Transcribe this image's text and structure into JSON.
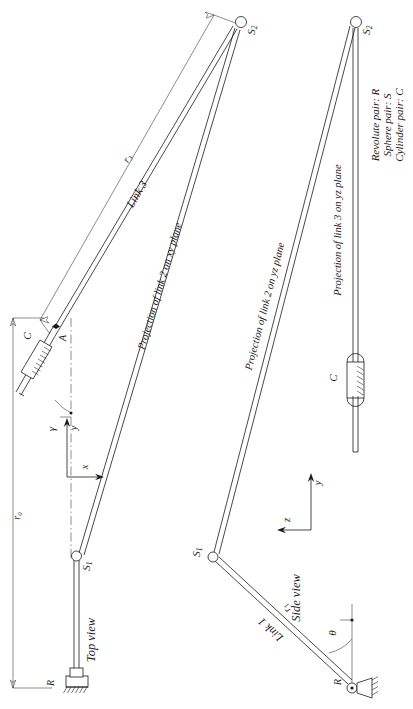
{
  "figure": {
    "views": {
      "top": "Top view",
      "side": "Side view"
    },
    "legend": {
      "items": [
        "Revolute pair: R",
        "Sphere pair: S",
        "Cylinder pair: C"
      ]
    },
    "labels": {
      "s1_top": "S₁",
      "s2_top": "S₂",
      "s1_side": "S₁",
      "s2_side": "S₂",
      "point_a": "A",
      "joint_c_top": "C",
      "joint_c_side": "C",
      "joint_r_top": "R",
      "joint_r_side": "R",
      "link1": "Link 1",
      "link3": "Link 3",
      "r0": "r₀",
      "r1": "r₁",
      "r3": "r₃",
      "gamma": "γ",
      "theta": "θ",
      "proj2_xy": "Projection of link 2 on xy plane",
      "proj2_yz": "Projection of link 2 on yz plane",
      "proj3_yz": "Projection of link 3 on yz plane"
    },
    "axes": {
      "top_view": {
        "horizontal": "x",
        "vertical": "y"
      },
      "side_view": {
        "horizontal": "z",
        "vertical": "y"
      }
    },
    "colors": {
      "ink": "#1a1a1a",
      "paper": "#ffffff"
    }
  }
}
